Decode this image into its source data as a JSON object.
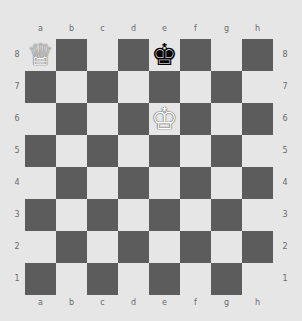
{
  "board": {
    "files": [
      "a",
      "b",
      "c",
      "d",
      "e",
      "f",
      "g",
      "h"
    ],
    "ranks": [
      "8",
      "7",
      "6",
      "5",
      "4",
      "3",
      "2",
      "1"
    ],
    "colors": {
      "light": "#e6e6e6",
      "dark": "#5c5c5c"
    },
    "pieces": [
      {
        "square": "a8",
        "type": "queen",
        "color": "white",
        "glyph": "♕"
      },
      {
        "square": "e8",
        "type": "king",
        "color": "black",
        "glyph": "♚"
      },
      {
        "square": "e6",
        "type": "king",
        "color": "white",
        "glyph": "♔"
      }
    ]
  }
}
